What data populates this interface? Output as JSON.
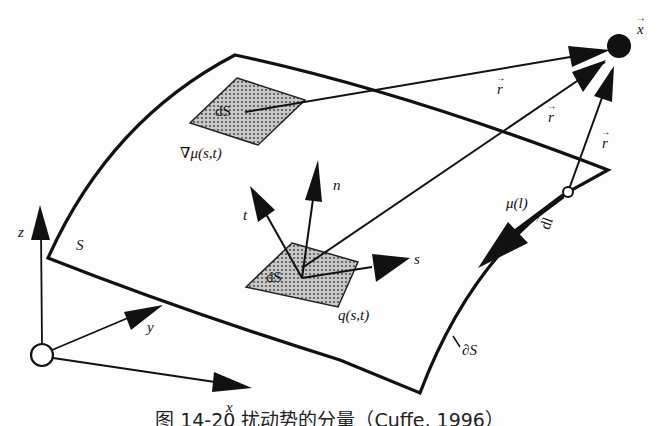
{
  "figure": {
    "caption": "图 14-20   扰动势的分量（Cuffe, 1996）",
    "labels": {
      "point_x": "x",
      "r_vector": "r",
      "dS": "dS",
      "grad_mu": "∇μ(s,t)",
      "normal_n": "n",
      "tangent_t": "t",
      "tangent_s": "s",
      "source_q": "q(s,t)",
      "surface_S": "S",
      "boundary_dS": "∂S",
      "doublet_mu_l": "μ(l)",
      "line_element_dl": "dl",
      "axis_x": "x",
      "axis_y": "y",
      "axis_z": "z"
    },
    "colors": {
      "ink": "#111111",
      "patch_fill": "#9a9a9a",
      "background": "#fdfdfd"
    }
  }
}
